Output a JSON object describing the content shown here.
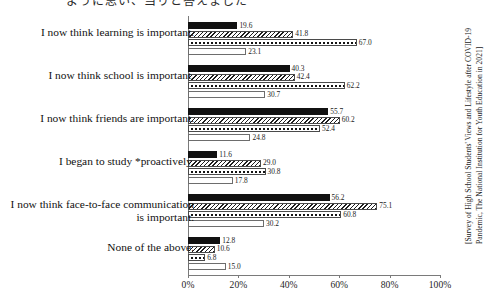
{
  "page": {
    "top_fragment": "ように思い、当りと答えました"
  },
  "chart_data": {
    "type": "bar",
    "orientation": "horizontal",
    "title": "",
    "xlabel": "",
    "ylabel": "",
    "xlim": [
      0,
      100
    ],
    "grid": false,
    "legend_position": "none",
    "categories": [
      "I now think learning is important.",
      "I now think school is important.",
      "I now think friends are important.",
      "I began to study *proactively.",
      "I now think face-to-face communication is important.",
      "None of the above."
    ],
    "series": [
      {
        "name": "series-1",
        "pattern": "solid-black",
        "values": [
          19.6,
          40.3,
          55.7,
          11.6,
          56.2,
          12.8
        ]
      },
      {
        "name": "series-2",
        "pattern": "diagonal-hatch",
        "values": [
          41.8,
          42.4,
          60.2,
          29.0,
          75.1,
          10.6
        ]
      },
      {
        "name": "series-3",
        "pattern": "dotted",
        "values": [
          67.0,
          62.2,
          52.4,
          30.8,
          60.8,
          6.8
        ]
      },
      {
        "name": "series-4",
        "pattern": "white-outline",
        "values": [
          23.1,
          30.7,
          24.8,
          17.8,
          30.2,
          15.0
        ]
      }
    ],
    "xticks": [
      {
        "value": 0,
        "label": "0%"
      },
      {
        "value": 20,
        "label": "20%"
      },
      {
        "value": 40,
        "label": "40%"
      },
      {
        "value": 60,
        "label": "60%"
      },
      {
        "value": 80,
        "label": "80%"
      },
      {
        "value": 100,
        "label": "100%"
      }
    ],
    "annotation": "[Survey of High School Students' Views and Lifestyle after COVID-19 Pandemic, The National Institution for Youth Education in 2021]"
  }
}
